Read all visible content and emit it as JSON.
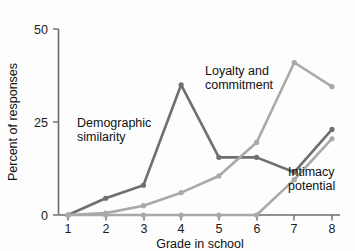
{
  "chart_data": {
    "type": "line",
    "title": "",
    "subtitle": "",
    "xlabel": "Grade in school",
    "ylabel": "Percent of responses",
    "x": [
      1,
      2,
      3,
      4,
      5,
      6,
      7,
      8
    ],
    "categories": [
      "1",
      "2",
      "3",
      "4",
      "5",
      "6",
      "7",
      "8"
    ],
    "xtick_labels": [
      "1",
      "2",
      "3",
      "4",
      "5",
      "6",
      "7",
      "8"
    ],
    "ytick_labels": [
      "0",
      "25",
      "50"
    ],
    "yticks": [
      0,
      25,
      50
    ],
    "xlim": [
      1,
      8
    ],
    "ylim": [
      0,
      50
    ],
    "grid": false,
    "legend_position": "inline-annotations",
    "series": [
      {
        "name": "Demographic similarity",
        "color": "#6f6f6f",
        "values": [
          0,
          4.5,
          8,
          35,
          15.5,
          15.5,
          11.5,
          23
        ]
      },
      {
        "name": "Loyalty and commitment",
        "color": "#a9a9a9",
        "values": [
          0,
          0.5,
          2.5,
          6,
          10.5,
          19.5,
          41,
          34.5
        ]
      },
      {
        "name": "Intimacy potential",
        "color": "#a9a9a9",
        "values": [
          0,
          0,
          0,
          0,
          0,
          0,
          9.5,
          20.5
        ]
      }
    ],
    "annotations": [
      {
        "id": "demographic",
        "line1": "Demographic",
        "line2": "similarity"
      },
      {
        "id": "loyalty",
        "line1": "Loyalty and",
        "line2": "commitment"
      },
      {
        "id": "intimacy",
        "line1": "Intimacy",
        "line2": "potential"
      }
    ]
  },
  "axes": {
    "y_title": "Percent of responses",
    "x_title": "Grade in school",
    "y_ticks": [
      "50",
      "25",
      "0"
    ],
    "x_ticks": [
      "1",
      "2",
      "3",
      "4",
      "5",
      "6",
      "7",
      "8"
    ]
  },
  "labels": {
    "demographic_l1": "Demographic",
    "demographic_l2": "similarity",
    "loyalty_l1": "Loyalty and",
    "loyalty_l2": "commitment",
    "intimacy_l1": "Intimacy",
    "intimacy_l2": "potential"
  },
  "colors": {
    "series_dark": "#6f6f6f",
    "series_light": "#a9a9a9",
    "axis": "#6b6b6b",
    "text": "#111111",
    "background": "#fdfdfd"
  }
}
